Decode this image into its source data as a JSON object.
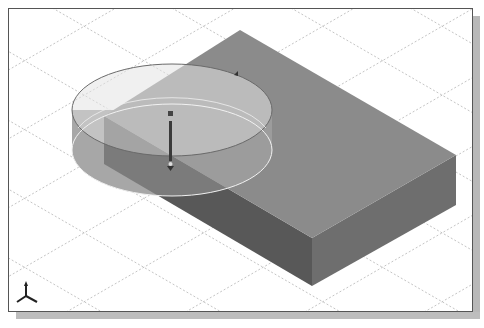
{
  "viewport": {
    "title": "3D model viewport",
    "background": "#ffffff",
    "grid": {
      "style": "isometric dashed",
      "color": "#b0b0b0"
    },
    "colors": {
      "box_top": "#8c8c8c",
      "box_left": "#5e5e5e",
      "box_right": "#6e6e6e",
      "cylinder_top": "#d8d8d8",
      "cylinder_side": "#9a9a9a",
      "frame_border": "#555555",
      "frame_shadow": "#b8b8b8"
    }
  },
  "scene": {
    "objects": [
      {
        "name": "rectangular-box",
        "type": "extruded block"
      },
      {
        "name": "cylinder-preview",
        "type": "transparent extrude preview"
      }
    ],
    "handles": [
      {
        "name": "extrude-direction-arrow",
        "type": "drag handle"
      },
      {
        "name": "radius-handle",
        "type": "drag handle"
      }
    ]
  },
  "triad": {
    "name": "axis-triad",
    "axes": [
      "X",
      "Y",
      "Z"
    ]
  }
}
